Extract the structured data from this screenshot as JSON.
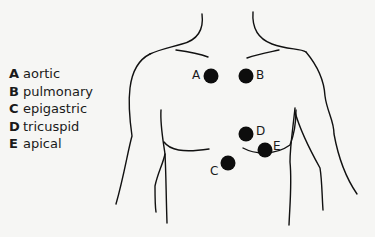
{
  "legend": {
    "items": [
      {
        "key": "A",
        "label": "aortic"
      },
      {
        "key": "B",
        "label": "pulmonary"
      },
      {
        "key": "C",
        "label": "epigastric"
      },
      {
        "key": "D",
        "label": "tricuspid"
      },
      {
        "key": "E",
        "label": "apical"
      }
    ]
  },
  "points": [
    {
      "key": "A",
      "name": "aortic",
      "cx": 211,
      "cy": 76
    },
    {
      "key": "B",
      "name": "pulmonary",
      "cx": 246,
      "cy": 76
    },
    {
      "key": "C",
      "name": "epigastric",
      "cx": 228,
      "cy": 163
    },
    {
      "key": "D",
      "name": "tricuspid",
      "cx": 246,
      "cy": 134
    },
    {
      "key": "E",
      "name": "apical",
      "cx": 264,
      "cy": 150
    }
  ],
  "colors": {
    "background": "#f6f6f4",
    "ink": "#111111"
  }
}
